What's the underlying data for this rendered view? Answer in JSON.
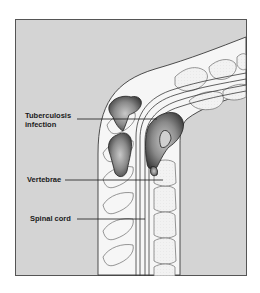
{
  "diagram": {
    "labels": {
      "tb_line1": "Tuberculosis",
      "tb_line2": "infection",
      "vertebrae": "Vertebrae",
      "spinal_cord": "Spinal cord"
    },
    "colors": {
      "background": "#d4d4d4",
      "frame_border": "#555555",
      "tissue": "#f4f4f4",
      "outline": "#3a3a3a",
      "vertebra_outline": "#6a6a6a",
      "infection_dark": "#4a4a4a",
      "infection_light": "#bdbdbd"
    }
  }
}
